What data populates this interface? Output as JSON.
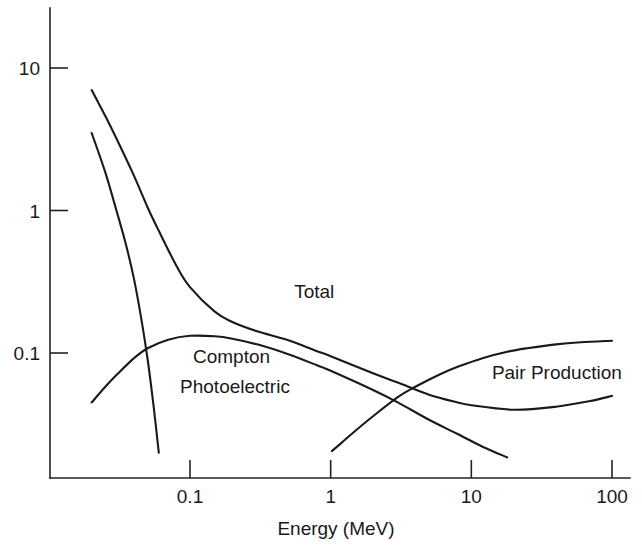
{
  "chart_data": {
    "type": "line",
    "title": "",
    "xlabel": "Energy (MeV)",
    "ylabel": "",
    "xscale": "log",
    "yscale": "log",
    "xlim": [
      0.02,
      140
    ],
    "ylim": [
      0.02,
      20
    ],
    "grid": false,
    "legend_position": "inline-labels",
    "xticks": [
      0.1,
      1,
      10,
      100
    ],
    "xtick_labels": [
      "0.1",
      "1",
      "10",
      "100"
    ],
    "yticks": [
      10,
      1,
      0.1
    ],
    "ytick_labels": [
      "10",
      "1",
      "0.1"
    ],
    "series": [
      {
        "name": "Total",
        "label": "Total",
        "label_x": 0.55,
        "label_y": 0.27,
        "x": [
          0.02,
          0.025,
          0.03,
          0.04,
          0.05,
          0.06,
          0.08,
          0.1,
          0.15,
          0.2,
          0.3,
          0.5,
          0.8,
          1.0,
          2.0,
          3.0,
          5.0,
          8.0,
          10.0,
          20.0,
          40.0,
          70.0,
          100.0
        ],
        "y": [
          7.0,
          4.6,
          3.2,
          1.75,
          1.05,
          0.72,
          0.41,
          0.29,
          0.195,
          0.165,
          0.142,
          0.123,
          0.103,
          0.095,
          0.072,
          0.062,
          0.051,
          0.045,
          0.043,
          0.04,
          0.042,
          0.046,
          0.05
        ]
      },
      {
        "name": "Photoelectric",
        "label": "Photoelectric",
        "label_x": 0.085,
        "label_y": 0.058,
        "x": [
          0.02,
          0.025,
          0.03,
          0.035,
          0.04,
          0.045,
          0.05,
          0.055,
          0.06
        ],
        "y": [
          3.5,
          1.85,
          1.0,
          0.58,
          0.33,
          0.175,
          0.09,
          0.043,
          0.02
        ]
      },
      {
        "name": "Compton",
        "label": "Compton",
        "label_x": 0.105,
        "label_y": 0.093,
        "x": [
          0.02,
          0.025,
          0.03,
          0.04,
          0.05,
          0.07,
          0.1,
          0.15,
          0.2,
          0.3,
          0.5,
          0.8,
          1.0,
          2.0,
          3.0,
          5.0,
          8.0,
          12.0,
          18.0
        ],
        "y": [
          0.045,
          0.058,
          0.07,
          0.092,
          0.108,
          0.124,
          0.132,
          0.131,
          0.126,
          0.115,
          0.098,
          0.082,
          0.075,
          0.055,
          0.045,
          0.034,
          0.027,
          0.022,
          0.0185
        ]
      },
      {
        "name": "Pair Production",
        "label": "Pair Production",
        "label_x": 14.0,
        "label_y": 0.072,
        "x": [
          1.02,
          1.2,
          1.5,
          2.0,
          3.0,
          4.0,
          6.0,
          8.0,
          12.0,
          18.0,
          25.0,
          40.0,
          60.0,
          100.0
        ],
        "y": [
          0.0205,
          0.0235,
          0.0285,
          0.036,
          0.049,
          0.058,
          0.071,
          0.08,
          0.092,
          0.102,
          0.108,
          0.115,
          0.119,
          0.122
        ]
      }
    ]
  },
  "axes": {
    "x_title": "Energy (MeV)"
  },
  "colors": {
    "curve": "#1a1a1a",
    "axis": "#222222",
    "background": "#ffffff"
  }
}
